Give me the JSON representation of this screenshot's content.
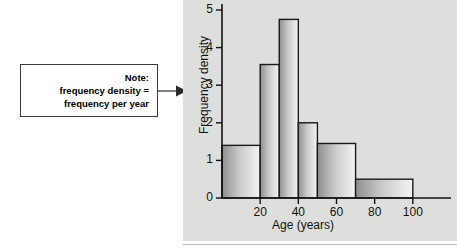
{
  "note": {
    "name": "note-callout",
    "lines": [
      "Note:",
      "frequency density =",
      "frequency per year"
    ],
    "border_color": "#3a3a3a",
    "background_color": "#ffffff"
  },
  "arrow": {
    "name": "pointer-arrow",
    "color": "#2b2b2b"
  },
  "panel": {
    "background_color": "#dededc"
  },
  "chart_data": {
    "type": "bar",
    "title": "",
    "subtitle": "",
    "xlabel": "Age (years)",
    "ylabel": "Frequency density",
    "xlim": [
      0,
      120
    ],
    "ylim": [
      0,
      5.35
    ],
    "grid": false,
    "legend": false,
    "bar_style": "histogram-contiguous",
    "bar_fill": "vertical-gradient-light-to-dark",
    "bar_edge_color": "#1a1a1a",
    "x_tick_labels": [
      "20",
      "40",
      "60",
      "80",
      "100"
    ],
    "x_tick_values": [
      20,
      40,
      60,
      80,
      100
    ],
    "y_tick_labels": [
      "0",
      "1",
      "2",
      "3",
      "4",
      "5"
    ],
    "y_tick_values": [
      0,
      1,
      2,
      3,
      4,
      5
    ],
    "bins": [
      {
        "label": "0-20",
        "start": 0,
        "end": 20,
        "value": 1.4
      },
      {
        "label": "20-30",
        "start": 20,
        "end": 30,
        "value": 3.55
      },
      {
        "label": "30-40",
        "start": 30,
        "end": 40,
        "value": 4.75
      },
      {
        "label": "40-50",
        "start": 40,
        "end": 50,
        "value": 2.0
      },
      {
        "label": "50-70",
        "start": 50,
        "end": 70,
        "value": 1.45
      },
      {
        "label": "70-100",
        "start": 70,
        "end": 100,
        "value": 0.5
      }
    ],
    "categories": [
      "0-20",
      "20-30",
      "30-40",
      "40-50",
      "50-70",
      "70-100"
    ],
    "values": [
      1.4,
      3.55,
      4.75,
      2.0,
      1.45,
      0.5
    ]
  }
}
